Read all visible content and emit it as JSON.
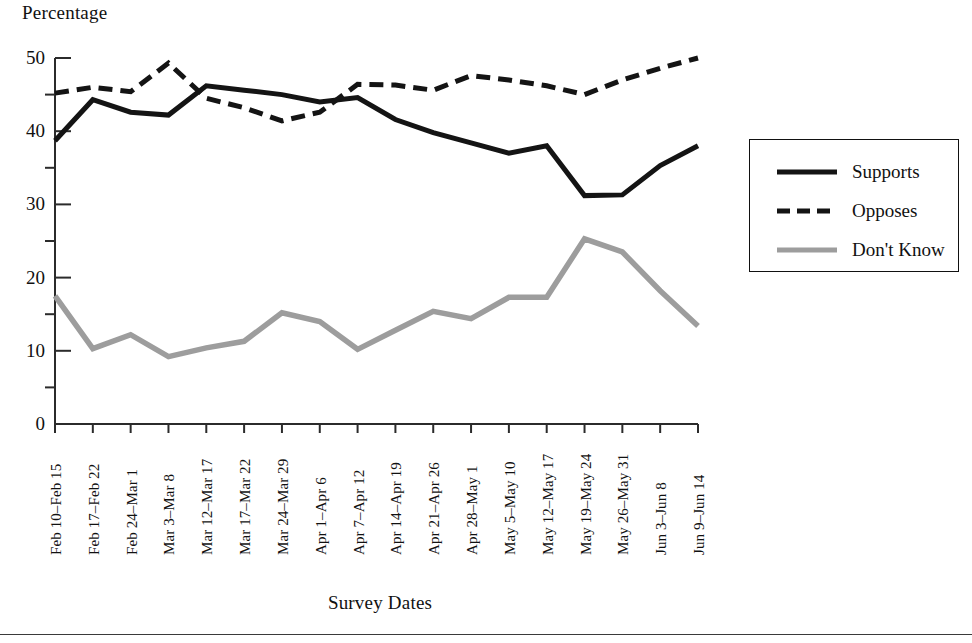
{
  "chart_data": {
    "type": "line",
    "title": "",
    "xlabel": "Survey Dates",
    "ylabel": "Percentage",
    "ylim": [
      0,
      50
    ],
    "yticks": [
      0,
      10,
      20,
      30,
      40,
      50
    ],
    "yticks_minor": [
      5,
      15,
      25,
      35,
      45
    ],
    "grid": false,
    "legend_position": "right",
    "categories": [
      "Feb 10–Feb 15",
      "Feb 17–Feb 22",
      "Feb 24–Mar 1",
      "Mar 3–Mar 8",
      "Mar 12–Mar 17",
      "Mar 17–Mar 22",
      "Mar 24–Mar 29",
      "Apr 1–Apr 6",
      "Apr 7–Apr 12",
      "Apr 14–Apr 19",
      "Apr 21–Apr 26",
      "Apr 28–May 1",
      "May 5–May 10",
      "May 12–May 17",
      "May 19–May 24",
      "May 26–May 31",
      "Jun 3–Jun 8",
      "Jun 9–Jun 14"
    ],
    "series": [
      {
        "name": "Supports",
        "style": "solid",
        "color": "#141414",
        "values": [
          38.7,
          44.3,
          42.6,
          42.2,
          46.2,
          45.6,
          45.0,
          44.0,
          44.6,
          41.6,
          39.8,
          38.4,
          37.0,
          38.0,
          31.2,
          31.3,
          35.3,
          38.0
        ]
      },
      {
        "name": "Opposes",
        "style": "dashed",
        "color": "#141414",
        "values": [
          45.2,
          46.0,
          45.4,
          49.3,
          44.5,
          43.2,
          41.4,
          42.6,
          46.4,
          46.3,
          45.6,
          47.6,
          47.0,
          46.2,
          45.0,
          47.0,
          48.6,
          50.0
        ]
      },
      {
        "name": "Don't Know",
        "style": "solid",
        "color": "#9d9d9d",
        "values": [
          17.5,
          10.3,
          12.2,
          9.2,
          10.4,
          11.3,
          15.2,
          14.0,
          10.2,
          12.8,
          15.4,
          14.4,
          17.3,
          17.3,
          25.3,
          23.5,
          18.2,
          13.4
        ]
      }
    ]
  },
  "axis": {
    "y_title": "Percentage",
    "x_title": "Survey Dates"
  },
  "legend": {
    "entries": [
      {
        "label": "Supports"
      },
      {
        "label": "Opposes"
      },
      {
        "label": "Don't Know"
      }
    ]
  },
  "colors": {
    "line_dark": "#141414",
    "line_gray": "#9d9d9d",
    "axis": "#2b2b2b",
    "text": "#111111",
    "background": "#ffffff"
  }
}
